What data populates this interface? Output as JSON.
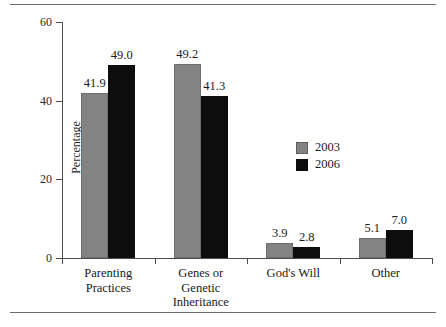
{
  "chart_data": {
    "type": "bar",
    "title": "",
    "xlabel": "",
    "ylabel": "Percentage",
    "ylim": [
      0,
      60
    ],
    "yticks": [
      0,
      20,
      40,
      60
    ],
    "ytick_labels": [
      "0",
      "20",
      "40",
      "60"
    ],
    "grid": false,
    "legend_position": "center-right",
    "categories": [
      "Parenting Practices",
      "Genes or Genetic Inheritance",
      "God's Will",
      "Other"
    ],
    "category_lines": [
      [
        "Parenting",
        "Practices"
      ],
      [
        "Genes or",
        "Genetic",
        "Inheritance"
      ],
      [
        "God's Will"
      ],
      [
        "Other"
      ]
    ],
    "series": [
      {
        "name": "2003",
        "color": "#838383",
        "values": [
          41.9,
          49.2,
          3.9,
          5.1
        ],
        "value_labels": [
          "41.9",
          "49.2",
          "3.9",
          "5.1"
        ]
      },
      {
        "name": "2006",
        "color": "#0d0d0d",
        "values": [
          49.0,
          41.3,
          2.8,
          7.0
        ],
        "value_labels": [
          "49.0",
          "41.3",
          "2.8",
          "7.0"
        ]
      }
    ]
  },
  "legend": {
    "entries": [
      {
        "label": "2003",
        "swatch": "gray-swatch"
      },
      {
        "label": "2006",
        "swatch": "black-swatch"
      }
    ]
  }
}
